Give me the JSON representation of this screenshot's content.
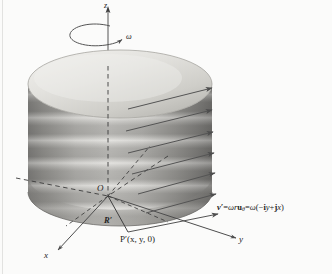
{
  "figure": {
    "background_color": "#fbfbfa",
    "ink_color": "#4a4a4a",
    "cylinder": {
      "top_fill_light": "#e6e5e2",
      "top_fill_dark": "#b9b8b4",
      "body_light": "#dedddb",
      "body_dark": "#7e7d7b",
      "band_count": 7
    },
    "axes": {
      "z_label": "z",
      "x_label": "x",
      "y_label": "y",
      "origin_label": "O"
    },
    "labels": {
      "omega": "ω",
      "position_vector": "R′",
      "point": "P′(x, y, 0)"
    },
    "equation": {
      "lhs": "v′",
      "eq1": "=",
      "mid_omega": "ω",
      "mid_r": "r",
      "mid_u": "u",
      "mid_u_sub": "θ",
      "eq2": "=",
      "rhs_omega": "ω",
      "rhs": "(−",
      "rhs_i": "i",
      "rhs_y": "y",
      "rhs_plus": "+",
      "rhs_j": "j",
      "rhs_x": "x",
      "rhs_close": ")",
      "full_text": "v′ = ωruθ = ω(−iy + jx)"
    },
    "velocity_arrows": {
      "count": 8,
      "direction": "pointing up-right, tangential to rotation",
      "color": "#545454"
    },
    "rotation_arrow": {
      "label": "ω",
      "direction": "counterclockwise viewed from +z"
    }
  }
}
